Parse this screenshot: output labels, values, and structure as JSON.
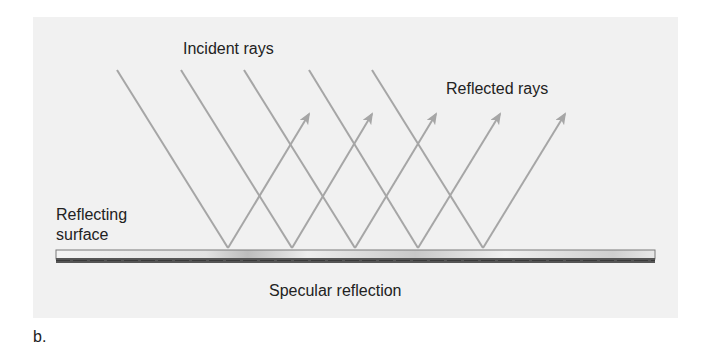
{
  "figure": {
    "labels": {
      "incident": "Incident rays",
      "reflected": "Reflected rays",
      "surface_line1": "Reflecting",
      "surface_line2": "surface",
      "caption": "Specular reflection",
      "panel_letter": "b."
    },
    "colors": {
      "background_panel": "#f1f1f1",
      "ray": "#a6a6a6",
      "text": "#222222",
      "surface_light": "#efefef",
      "surface_dark": "#555555"
    },
    "rays": {
      "count": 5,
      "incident_starts": [
        [
          117,
          70
        ],
        [
          181,
          70
        ],
        [
          244,
          70
        ],
        [
          309,
          70
        ],
        [
          372,
          70
        ]
      ],
      "bounce_points": [
        [
          228,
          248
        ],
        [
          292,
          248
        ],
        [
          355,
          248
        ],
        [
          418,
          248
        ],
        [
          483,
          248
        ]
      ],
      "reflected_tips": [
        [
          311,
          111
        ],
        [
          374,
          111
        ],
        [
          438,
          111
        ],
        [
          502,
          111
        ],
        [
          567,
          111
        ]
      ]
    },
    "surface": {
      "x": 56,
      "y": 250,
      "width": 599,
      "height": 13
    }
  }
}
